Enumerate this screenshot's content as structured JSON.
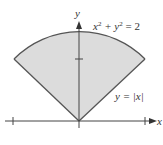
{
  "diagram": {
    "region_fill": "#dcdcdc",
    "stroke_color": "#555555",
    "axis_color": "#444444",
    "labels": {
      "x_axis": "x",
      "y_axis": "y",
      "circle_eq_base": "x",
      "circle_eq_sup1": "2",
      "circle_eq_mid": " + y",
      "circle_eq_sup2": "2",
      "circle_eq_end": " = 2",
      "line_eq": "y = |x|"
    },
    "ticks": {
      "x": [
        -1,
        1
      ],
      "y": [
        1
      ]
    },
    "curves": [
      {
        "name": "circle",
        "equation": "x^2 + y^2 = 2"
      },
      {
        "name": "abs-line",
        "equation": "y = |x|"
      }
    ]
  }
}
